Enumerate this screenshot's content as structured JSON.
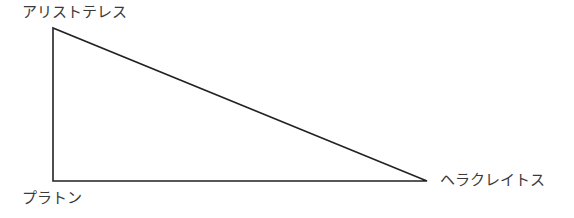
{
  "diagram": {
    "type": "triangle",
    "vertices": [
      {
        "name": "top-left",
        "label": "アリストテレス",
        "x": 53,
        "y": 28
      },
      {
        "name": "bottom-left",
        "label": "プラトン",
        "x": 53,
        "y": 181
      },
      {
        "name": "right",
        "label": "ヘラクレイトス",
        "x": 427,
        "y": 181
      }
    ],
    "stroke_color": "#222222"
  },
  "labels": {
    "top": "アリストテレス",
    "bottom_left": "プラトン",
    "right": "ヘラクレイトス"
  }
}
